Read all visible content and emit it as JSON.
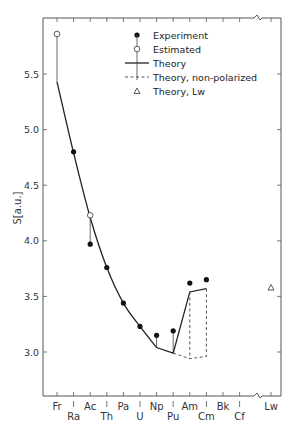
{
  "chart_data": {
    "type": "scatter",
    "title": "",
    "xlabel": "",
    "ylabel": "S[a.u.]",
    "ylim": [
      2.6,
      6.02
    ],
    "yticks": [
      3.0,
      3.5,
      4.0,
      4.5,
      5.0,
      5.5
    ],
    "ytick_labels": [
      "3.0",
      "3.5",
      "4.0",
      "4.5",
      "5.0",
      "5.5"
    ],
    "categories": [
      "Fr",
      "Ra",
      "Ac",
      "Th",
      "Pa",
      "U",
      "Np",
      "Pu",
      "Am",
      "Cm",
      "Bk",
      "Cf",
      "Lw"
    ],
    "axis_break_between": [
      "Cf",
      "Lw"
    ],
    "grid": false,
    "legend_position": "top-right",
    "series": [
      {
        "name": "Experiment",
        "marker": "filled-circle",
        "points": [
          {
            "x": "Ra",
            "y": 4.8
          },
          {
            "x": "Ac",
            "y": 3.97
          },
          {
            "x": "Th",
            "y": 3.76
          },
          {
            "x": "Pa",
            "y": 3.44
          },
          {
            "x": "U",
            "y": 3.23
          },
          {
            "x": "Np",
            "y": 3.15
          },
          {
            "x": "Pu",
            "y": 3.19
          },
          {
            "x": "Am",
            "y": 3.62
          },
          {
            "x": "Cm",
            "y": 3.65
          }
        ]
      },
      {
        "name": "Estimated",
        "marker": "open-circle",
        "points": [
          {
            "x": "Fr",
            "y": 5.86
          },
          {
            "x": "Ac",
            "y": 4.23
          }
        ]
      },
      {
        "name": "Theory",
        "style": "solid-line",
        "points": [
          {
            "x": "Fr",
            "y": 5.43
          },
          {
            "x": "Ra",
            "y": 4.79
          },
          {
            "x": "Ac",
            "y": 4.21
          },
          {
            "x": "Th",
            "y": 3.76
          },
          {
            "x": "Pa",
            "y": 3.44
          },
          {
            "x": "U",
            "y": 3.23
          },
          {
            "x": "Np",
            "y": 3.04
          },
          {
            "x": "Pu",
            "y": 2.99
          },
          {
            "x": "Am",
            "y": 3.54
          },
          {
            "x": "Cm",
            "y": 3.57
          }
        ]
      },
      {
        "name": "Theory, non-polarized",
        "style": "dashed-line",
        "points": [
          {
            "x": "Pu",
            "y": 2.99
          },
          {
            "x": "Am",
            "y": 2.94
          },
          {
            "x": "Cm",
            "y": 2.96
          }
        ]
      },
      {
        "name": "Theory, Lw",
        "marker": "open-triangle",
        "points": [
          {
            "x": "Lw",
            "y": 3.58
          }
        ]
      }
    ],
    "legend": [
      "Experiment",
      "Estimated",
      "Theory",
      "Theory, non-polarized",
      "Theory, Lw"
    ]
  }
}
